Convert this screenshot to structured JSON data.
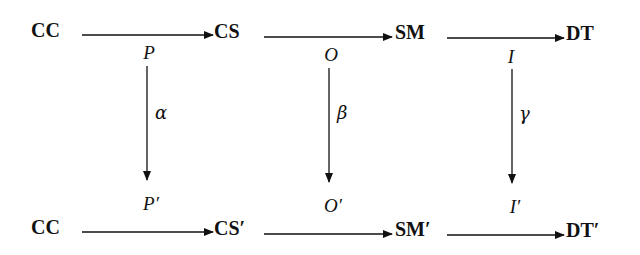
{
  "diagram": {
    "type": "commutative-diagram",
    "top_row": [
      {
        "id": "cc_top",
        "label": "CC"
      },
      {
        "id": "cs_top",
        "label": "CS"
      },
      {
        "id": "sm_top",
        "label": "SM"
      },
      {
        "id": "dt_top",
        "label": "DT"
      }
    ],
    "bottom_row": [
      {
        "id": "cc_bottom",
        "label": "CC"
      },
      {
        "id": "cs_bottom",
        "label": "CS′"
      },
      {
        "id": "sm_bottom",
        "label": "SM′"
      },
      {
        "id": "dt_bottom",
        "label": "DT′"
      }
    ],
    "top_arrow_labels": [
      "P",
      "O",
      "I"
    ],
    "bottom_arrow_labels": [
      "P′",
      "O′",
      "I′"
    ],
    "vertical_maps": [
      "α",
      "β",
      "γ"
    ],
    "edges": [
      {
        "from": "CC",
        "to": "CS",
        "label": "P"
      },
      {
        "from": "CS",
        "to": "SM",
        "label": "O"
      },
      {
        "from": "SM",
        "to": "DT",
        "label": "I"
      },
      {
        "from": "CC",
        "to": "CS′",
        "label": "P′"
      },
      {
        "from": "CS′",
        "to": "SM′",
        "label": "O′"
      },
      {
        "from": "SM′",
        "to": "DT′",
        "label": "I′"
      },
      {
        "from": "P",
        "to": "P′",
        "label": "α"
      },
      {
        "from": "O",
        "to": "O′",
        "label": "β"
      },
      {
        "from": "I",
        "to": "I′",
        "label": "γ"
      }
    ]
  }
}
